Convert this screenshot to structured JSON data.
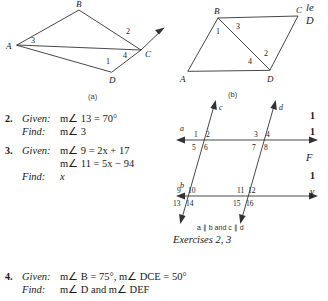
{
  "figures": {
    "a": {
      "caption": "(a)",
      "vertices": [
        {
          "name": "A",
          "x": 13,
          "y": 43
        },
        {
          "name": "B",
          "x": 75,
          "y": 8
        },
        {
          "name": "C",
          "x": 137,
          "y": 48
        },
        {
          "name": "D",
          "x": 108,
          "y": 70
        }
      ],
      "angles": [
        {
          "label": "3",
          "x": 30,
          "y": 39
        },
        {
          "label": "2",
          "x": 123,
          "y": 30
        },
        {
          "label": "4",
          "x": 120,
          "y": 52
        },
        {
          "label": "1",
          "x": 108,
          "y": 60
        }
      ]
    },
    "b": {
      "caption": "(b)",
      "vertices": [
        {
          "name": "A",
          "x": 10,
          "y": 67
        },
        {
          "name": "B",
          "x": 40,
          "y": 14
        },
        {
          "name": "C",
          "x": 120,
          "y": 12
        },
        {
          "name": "D",
          "x": 92,
          "y": 66
        }
      ],
      "angles": [
        {
          "label": "1",
          "x": 41,
          "y": 27
        },
        {
          "label": "3",
          "x": 60,
          "y": 22
        },
        {
          "label": "2",
          "x": 88,
          "y": 48
        },
        {
          "label": "4",
          "x": 72,
          "y": 56
        }
      ]
    },
    "transversal": {
      "line_labels": [
        "a",
        "b",
        "c",
        "d"
      ],
      "angle_numbers": [
        "1",
        "2",
        "3",
        "4",
        "5",
        "6",
        "7",
        "8",
        "9",
        "10",
        "11",
        "12",
        "13",
        "14",
        "15",
        "16"
      ],
      "parallel_note": "a ∥ b and c ∥ d",
      "exercises_caption": "Exercises 2, 3"
    }
  },
  "problems": [
    {
      "number": "2.",
      "given_label": "Given:",
      "given_lines": [
        "m∠ 13 = 70°"
      ],
      "find_label": "Find:",
      "find_lines": [
        "m∠ 3"
      ]
    },
    {
      "number": "3.",
      "given_label": "Given:",
      "given_lines": [
        "m∠ 9 = 2x + 17",
        "m∠ 11 = 5x − 94"
      ],
      "find_label": "Find:",
      "find_lines": [
        "x"
      ]
    },
    {
      "number": "4.",
      "given_label": "Given:",
      "given_lines": [
        "m∠ B = 75°, m∠ DCE = 50°"
      ],
      "find_label": "Find:",
      "find_lines": [
        "m∠ D and m∠ DEF"
      ]
    }
  ],
  "clipped_right_column": {
    "fragments": [
      {
        "text": "le",
        "x": 306,
        "y": 4
      },
      {
        "text": "D",
        "x": 306,
        "y": 17
      },
      {
        "text": "1",
        "x": 310,
        "y": 112
      },
      {
        "text": "1",
        "x": 310,
        "y": 128
      },
      {
        "text": "F",
        "x": 306,
        "y": 154
      },
      {
        "text": "1",
        "x": 310,
        "y": 172
      },
      {
        "text": "γ",
        "x": 310,
        "y": 188
      }
    ]
  },
  "colors": {
    "ink": "#1a1a1a",
    "line": "#333333",
    "paper": "#ffffff"
  }
}
